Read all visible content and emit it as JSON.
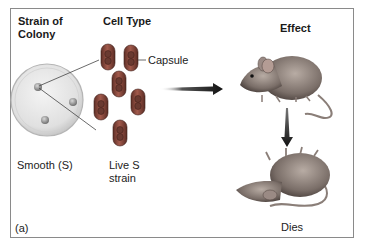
{
  "figure": {
    "panel_label": "(a)",
    "headers": {
      "strain_of_colony": "Strain of\nColony",
      "cell_type": "Cell Type",
      "effect": "Effect"
    },
    "labels": {
      "capsule": "Capsule",
      "smooth": "Smooth (S)",
      "live_s_strain": "Live S\nstrain",
      "dies": "Dies"
    },
    "icons": {
      "petri_dish": "petri-dish-with-colonies",
      "bacteria": "encapsulated-bacteria-cells",
      "mouse_alive": "mouse",
      "mouse_dead": "dead-mouse",
      "arrow_right": "arrow-right",
      "arrow_down": "arrow-down"
    },
    "colors": {
      "frame": "#8a8a8a",
      "cell_capsule": "#8a4a3e",
      "dish": "#e2e2e2",
      "arrow": "#1a1a1a"
    }
  }
}
